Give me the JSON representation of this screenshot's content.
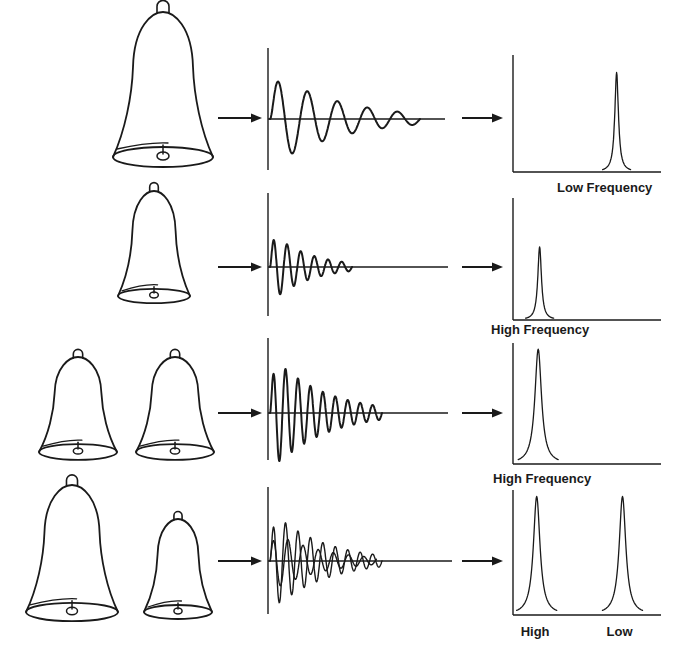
{
  "figure": {
    "ink_color": "#1a1a1a",
    "background": "#ffffff"
  },
  "rows": [
    {
      "id": "large-bell",
      "bells": [
        {
          "size": "large"
        }
      ],
      "waveform": {
        "cycles": 5,
        "relative_frequency": "low",
        "components": 1
      },
      "spectrum": {
        "peaks": [
          {
            "position": 0.7,
            "height": 0.85,
            "width": "narrow"
          }
        ]
      },
      "labels": [
        {
          "text": "Low Frequency",
          "anchor": "right"
        }
      ]
    },
    {
      "id": "small-bell",
      "bells": [
        {
          "size": "small"
        }
      ],
      "waveform": {
        "cycles": 6,
        "relative_frequency": "high",
        "components": 1
      },
      "spectrum": {
        "peaks": [
          {
            "position": 0.18,
            "height": 0.6,
            "width": "narrow"
          }
        ]
      },
      "labels": [
        {
          "text": "High Frequency",
          "anchor": "left"
        }
      ]
    },
    {
      "id": "two-small-bells",
      "bells": [
        {
          "size": "small"
        },
        {
          "size": "small"
        }
      ],
      "waveform": {
        "cycles": 9,
        "relative_frequency": "high",
        "components": 1,
        "amplitude": "double"
      },
      "spectrum": {
        "peaks": [
          {
            "position": 0.17,
            "height": 0.95,
            "width": "wide"
          }
        ]
      },
      "labels": [
        {
          "text": "High Frequency",
          "anchor": "left"
        }
      ]
    },
    {
      "id": "large-and-small-bell",
      "bells": [
        {
          "size": "large"
        },
        {
          "size": "small"
        }
      ],
      "waveform": {
        "cycles": 9,
        "relative_frequency": "mixed",
        "components": 2
      },
      "spectrum": {
        "peaks": [
          {
            "position": 0.16,
            "height": 0.95,
            "width": "wide"
          },
          {
            "position": 0.74,
            "height": 0.95,
            "width": "wide"
          }
        ]
      },
      "labels": [
        {
          "text": "High",
          "anchor": "peak-0"
        },
        {
          "text": "Low",
          "anchor": "peak-1"
        }
      ]
    }
  ]
}
